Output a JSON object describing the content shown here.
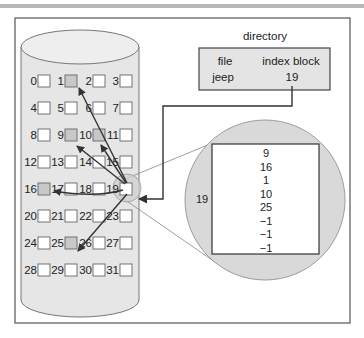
{
  "diagram": {
    "colors": {
      "frame": "#555555",
      "cylinder_fill": "#e6e6e6",
      "cylinder_stroke": "#777777",
      "block_empty": "#ffffff",
      "block_used": "#c8c8c8",
      "magnifier_fill": "#d9d9d9",
      "arrow": "#333333",
      "zoom_line": "#888888"
    },
    "disk": {
      "blocks": [
        "0",
        "1",
        "2",
        "3",
        "4",
        "5",
        "6",
        "7",
        "8",
        "9",
        "10",
        "11",
        "12",
        "13",
        "14",
        "15",
        "16",
        "17",
        "18",
        "19",
        "20",
        "21",
        "22",
        "23",
        "24",
        "25",
        "26",
        "27",
        "28",
        "29",
        "30",
        "31"
      ],
      "used_blocks": [
        1,
        9,
        10,
        16,
        25
      ],
      "index_block_number": "19"
    },
    "directory": {
      "title": "directory",
      "columns": [
        "file",
        "index block"
      ],
      "rows": [
        {
          "file": "jeep",
          "index_block": "19"
        }
      ]
    },
    "index_block_zoom": {
      "label": "19",
      "entries": [
        "9",
        "16",
        "1",
        "10",
        "25",
        "−1",
        "−1",
        "−1"
      ]
    }
  }
}
